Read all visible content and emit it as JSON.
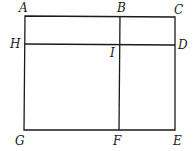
{
  "diagram": {
    "type": "rectangle-partition",
    "points": {
      "A": {
        "label": "A",
        "x": 25,
        "y": 16
      },
      "B": {
        "label": "B",
        "x": 120,
        "y": 16
      },
      "C": {
        "label": "C",
        "x": 175,
        "y": 16
      },
      "D": {
        "label": "D",
        "x": 175,
        "y": 45
      },
      "E": {
        "label": "E",
        "x": 175,
        "y": 130
      },
      "F": {
        "label": "F",
        "x": 119,
        "y": 130
      },
      "G": {
        "label": "G",
        "x": 24,
        "y": 130
      },
      "H": {
        "label": "H",
        "x": 25,
        "y": 44
      },
      "I": {
        "label": "I",
        "x": 120,
        "y": 45
      }
    },
    "segments": [
      [
        "A",
        "C"
      ],
      [
        "C",
        "E"
      ],
      [
        "E",
        "G"
      ],
      [
        "G",
        "A"
      ],
      [
        "B",
        "F"
      ],
      [
        "H",
        "D"
      ]
    ]
  }
}
